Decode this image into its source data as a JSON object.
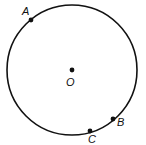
{
  "diagram": {
    "type": "circle-with-points",
    "circle": {
      "cx": 72,
      "cy": 70,
      "r": 65,
      "stroke": "#111111"
    },
    "center": {
      "label": "O",
      "x": 72,
      "y": 70,
      "label_x": 66,
      "label_y": 86
    },
    "points": [
      {
        "label": "A",
        "x": 31,
        "y": 20,
        "label_x": 22,
        "label_y": 15
      },
      {
        "label": "B",
        "x": 113,
        "y": 119,
        "label_x": 117,
        "label_y": 126
      },
      {
        "label": "C",
        "x": 90,
        "y": 131,
        "label_x": 88,
        "label_y": 143
      }
    ]
  }
}
